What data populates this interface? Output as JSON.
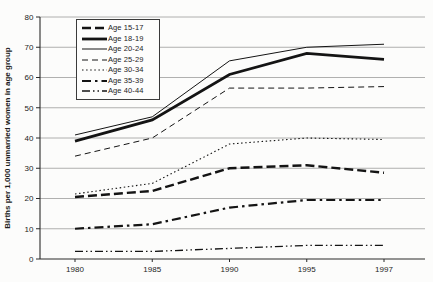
{
  "colors": {
    "line": "#141414",
    "grid": "#9c9c9c",
    "axis": "#2a2a2a",
    "text": "#1c1c1c",
    "background": "#fcfcfb"
  },
  "chart_data": {
    "type": "line",
    "title": "",
    "xlabel": "",
    "ylabel": "Births per 1,000 unmarried women in age group",
    "x": [
      "1980",
      "1985",
      "1990",
      "1995",
      "1997"
    ],
    "ylim": [
      0,
      80
    ],
    "ytick_interval": 10,
    "grid": "horizontal",
    "legend_position": "top-left-inside",
    "series": [
      {
        "name": "Age 15-17",
        "style": "thick-dashed",
        "values": [
          20.5,
          22.5,
          30,
          31,
          28.5
        ]
      },
      {
        "name": "Age 18-19",
        "style": "thick-solid",
        "values": [
          39,
          46,
          61,
          68,
          66
        ]
      },
      {
        "name": "Age 20-24",
        "style": "thin-solid",
        "values": [
          41,
          47,
          65.5,
          70,
          71
        ]
      },
      {
        "name": "Age 25-29",
        "style": "thin-dashed",
        "values": [
          34,
          40,
          56.5,
          56.5,
          57
        ]
      },
      {
        "name": "Age 30-34",
        "style": "dotted",
        "values": [
          21.5,
          25,
          38,
          40,
          39.5
        ]
      },
      {
        "name": "Age 35-39",
        "style": "thick-dashdot",
        "values": [
          10,
          11.5,
          17,
          19.5,
          19.5
        ]
      },
      {
        "name": "Age 40-44",
        "style": "dashdotdot",
        "values": [
          2.5,
          2.5,
          3.5,
          4.5,
          4.5
        ]
      }
    ]
  }
}
